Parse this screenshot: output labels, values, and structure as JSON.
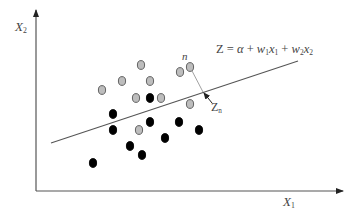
{
  "diagram": {
    "type": "linear-classifier-hyperplane",
    "axes": {
      "x_label": "X",
      "x_label_sub": "1",
      "y_label": "X",
      "y_label_sub": "2",
      "origin": [
        36,
        191
      ],
      "x_end": [
        343,
        191
      ],
      "y_end": [
        36,
        10
      ],
      "color": "#555555"
    },
    "hyperplane": {
      "equation_text": "Z = α + w₁x₁ + w₂x₂",
      "equation_parts": {
        "lhs": "Z",
        "eq": " = ",
        "alpha": "α",
        "plus1": " + ",
        "w1": "w",
        "w1_sub": "1",
        "x1": "x",
        "x1_sub": "1",
        "plus2": " + ",
        "w2": "w",
        "w2_sub": "2",
        "x2": "x",
        "x2_sub": "2"
      },
      "start": [
        51,
        143
      ],
      "end": [
        298,
        61
      ],
      "color": "#555555"
    },
    "annotations": {
      "point_label": "n",
      "projection_label": "Z",
      "projection_label_sub": "n",
      "projection_from": [
        190,
        67
      ],
      "projection_to": [
        203,
        92
      ],
      "arrow_from": [
        212,
        103
      ],
      "arrow_to": [
        204,
        93
      ]
    },
    "classes": [
      {
        "name": "gray",
        "fill": "#bdbdbd",
        "stroke": "#555555",
        "points": [
          [
            141,
            65
          ],
          [
            102,
            90
          ],
          [
            122,
            81
          ],
          [
            150,
            81
          ],
          [
            180,
            72
          ],
          [
            190,
            67
          ],
          [
            136,
            98
          ],
          [
            161,
            98
          ],
          [
            190,
            104
          ],
          [
            139,
            130
          ]
        ]
      },
      {
        "name": "black",
        "fill": "#000000",
        "stroke": "#000000",
        "points": [
          [
            150,
            98
          ],
          [
            113,
            114
          ],
          [
            113,
            130
          ],
          [
            150,
            122
          ],
          [
            179,
            122
          ],
          [
            199,
            130
          ],
          [
            165,
            138
          ],
          [
            130,
            146
          ],
          [
            142,
            155
          ],
          [
            93,
            163
          ]
        ]
      }
    ]
  }
}
